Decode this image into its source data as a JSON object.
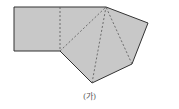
{
  "figure": {
    "caption": "(가)",
    "fill_color": "#c8c8c8",
    "stroke_color": "#333333",
    "dash_color": "#555555",
    "outline_points": [
      [
        14,
        7
      ],
      [
        106,
        7
      ],
      [
        148,
        23
      ],
      [
        132,
        64
      ],
      [
        92,
        83
      ],
      [
        60,
        51
      ],
      [
        14,
        51
      ]
    ],
    "dashed_lines": [
      [
        [
          60,
          7
        ],
        [
          60,
          51
        ]
      ],
      [
        [
          60,
          51
        ],
        [
          106,
          7
        ]
      ],
      [
        [
          92,
          83
        ],
        [
          106,
          7
        ]
      ],
      [
        [
          132,
          64
        ],
        [
          106,
          7
        ]
      ]
    ]
  }
}
